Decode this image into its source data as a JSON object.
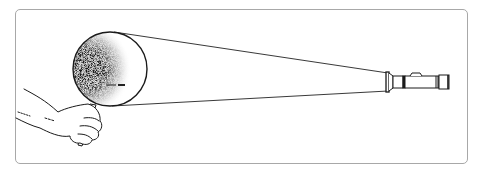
{
  "figure": {
    "elements": [
      {
        "name": "frame",
        "kind": "rounded rectangle border"
      },
      {
        "name": "hand",
        "kind": "line drawing"
      },
      {
        "name": "magnifying-glass",
        "kind": "lens with stippled shading on left side and small dash mark"
      },
      {
        "name": "light-beam",
        "kind": "two converging lines"
      },
      {
        "name": "flashlight",
        "kind": "side-view line drawing"
      }
    ],
    "colors": {
      "frame": "#a8a8a8",
      "ink": "#1a1a1a",
      "background": "#ffffff"
    }
  }
}
